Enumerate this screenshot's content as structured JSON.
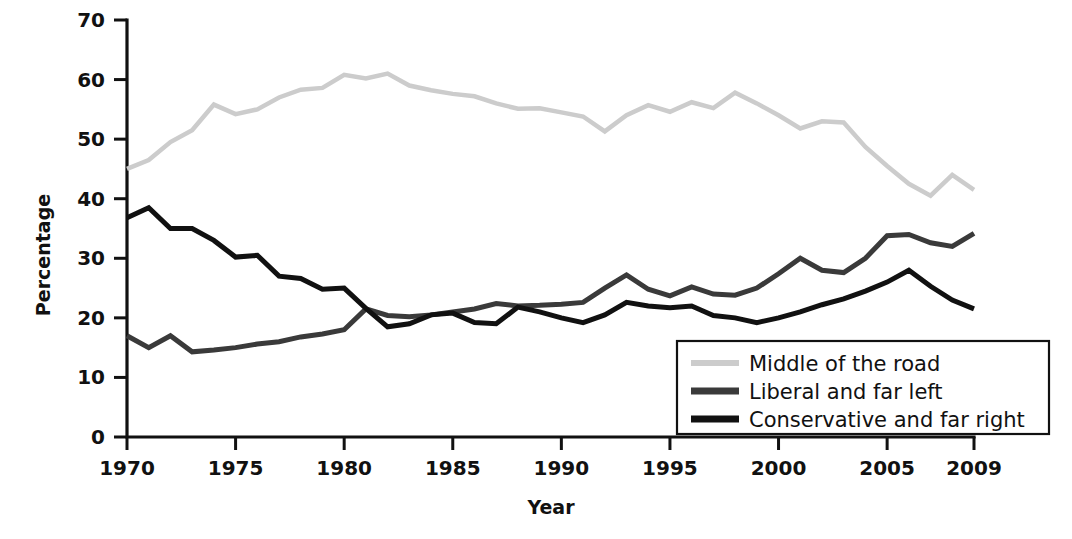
{
  "chart_data": {
    "type": "line",
    "title": "",
    "xlabel": "Year",
    "ylabel": "Percentage",
    "xlim": [
      1970,
      2009
    ],
    "ylim": [
      0,
      70
    ],
    "grid": false,
    "legend_position": "bottom-right",
    "yticks": [
      "0",
      "10",
      "20",
      "30",
      "40",
      "50",
      "60",
      "70"
    ],
    "ytick_values": [
      0,
      10,
      20,
      30,
      40,
      50,
      60,
      70
    ],
    "xticks": [
      "1970",
      "1975",
      "1980",
      "1985",
      "1990",
      "1995",
      "2000",
      "2005",
      "2009"
    ],
    "xtick_values": [
      1970,
      1975,
      1980,
      1985,
      1990,
      1995,
      2000,
      2005,
      2009
    ],
    "x": [
      1970,
      1971,
      1972,
      1973,
      1974,
      1975,
      1976,
      1977,
      1978,
      1979,
      1980,
      1981,
      1982,
      1983,
      1984,
      1985,
      1986,
      1987,
      1988,
      1989,
      1990,
      1991,
      1992,
      1993,
      1994,
      1995,
      1996,
      1997,
      1998,
      1999,
      2000,
      2001,
      2002,
      2003,
      2004,
      2005,
      2006,
      2007,
      2008,
      2009
    ],
    "series": [
      {
        "name": "Middle of the road",
        "color": "#cccccc",
        "width": 4.5,
        "values": [
          45.0,
          46.5,
          49.5,
          51.5,
          55.8,
          54.2,
          55.0,
          57.0,
          58.3,
          58.6,
          60.8,
          60.2,
          61.0,
          59.0,
          58.2,
          57.6,
          57.2,
          56.0,
          55.1,
          55.2,
          54.5,
          53.8,
          51.3,
          54.0,
          55.7,
          54.6,
          56.2,
          55.2,
          57.8,
          56.0,
          54.0,
          51.8,
          53.0,
          52.8,
          48.7,
          45.5,
          42.5,
          40.5,
          44.0,
          41.5
        ]
      },
      {
        "name": "Liberal and far left",
        "color": "#3a3a3a",
        "width": 5.0,
        "values": [
          17.0,
          15.0,
          17.0,
          14.3,
          14.6,
          15.0,
          15.6,
          16.0,
          16.8,
          17.3,
          18.0,
          21.5,
          20.4,
          20.2,
          20.5,
          21.0,
          21.5,
          22.4,
          22.0,
          22.1,
          22.3,
          22.6,
          25.0,
          27.2,
          24.8,
          23.7,
          25.2,
          24.0,
          23.8,
          25.0,
          27.4,
          30.0,
          28.0,
          27.6,
          30.0,
          33.8,
          34.0,
          32.6,
          32.0,
          34.2
        ]
      },
      {
        "name": "Conservative and far right",
        "color": "#111111",
        "width": 5.0,
        "values": [
          36.8,
          38.5,
          35.0,
          35.0,
          33.0,
          30.2,
          30.5,
          27.0,
          26.6,
          24.8,
          25.0,
          21.6,
          18.5,
          19.0,
          20.5,
          20.8,
          19.2,
          19.0,
          21.8,
          21.0,
          20.0,
          19.2,
          20.5,
          22.6,
          22.0,
          21.7,
          22.0,
          20.4,
          20.0,
          19.2,
          20.0,
          21.0,
          22.2,
          23.2,
          24.5,
          26.0,
          28.0,
          25.3,
          23.0,
          21.5
        ]
      }
    ],
    "legend": [
      {
        "label": "Middle of the road",
        "color": "#cccccc"
      },
      {
        "label": "Liberal and far left",
        "color": "#3a3a3a"
      },
      {
        "label": "Conservative and far right",
        "color": "#111111"
      }
    ]
  }
}
